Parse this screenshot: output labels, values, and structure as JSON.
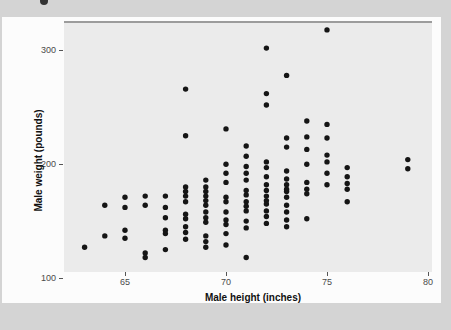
{
  "page": {
    "background_color": "#d4d4d4",
    "card_color": "#fcfcfc"
  },
  "chart_data": {
    "type": "scatter",
    "title": "",
    "xlabel": "Male height (inches)",
    "ylabel": "Male weight (pounds)",
    "x_ticks": [
      65,
      70,
      75,
      80
    ],
    "y_ticks": [
      100,
      200,
      300
    ],
    "xlim": [
      62,
      80.2
    ],
    "ylim": [
      95,
      326
    ],
    "grid": "off",
    "legend": "none",
    "panel_color": "#ebebeb",
    "point_color": "#151515",
    "points": [
      [
        63,
        127
      ],
      [
        64,
        164
      ],
      [
        64,
        137
      ],
      [
        65,
        171
      ],
      [
        65,
        162
      ],
      [
        65,
        142
      ],
      [
        65,
        135
      ],
      [
        66,
        172
      ],
      [
        66,
        164
      ],
      [
        66,
        122
      ],
      [
        66,
        118
      ],
      [
        67,
        172
      ],
      [
        67,
        162
      ],
      [
        67,
        153
      ],
      [
        67,
        142
      ],
      [
        67,
        139
      ],
      [
        67,
        125
      ],
      [
        68,
        266
      ],
      [
        68,
        225
      ],
      [
        68,
        180
      ],
      [
        68,
        176
      ],
      [
        68,
        172
      ],
      [
        68,
        167
      ],
      [
        68,
        156
      ],
      [
        68,
        152
      ],
      [
        68,
        145
      ],
      [
        68,
        140
      ],
      [
        68,
        134
      ],
      [
        69,
        186
      ],
      [
        69,
        180
      ],
      [
        69,
        176
      ],
      [
        69,
        172
      ],
      [
        69,
        168
      ],
      [
        69,
        164
      ],
      [
        69,
        158
      ],
      [
        69,
        153
      ],
      [
        69,
        149
      ],
      [
        69,
        137
      ],
      [
        69,
        132
      ],
      [
        69,
        127
      ],
      [
        70,
        231
      ],
      [
        70,
        200
      ],
      [
        70,
        192
      ],
      [
        70,
        184
      ],
      [
        70,
        171
      ],
      [
        70,
        167
      ],
      [
        70,
        158
      ],
      [
        70,
        151
      ],
      [
        70,
        147
      ],
      [
        70,
        139
      ],
      [
        70,
        129
      ],
      [
        71,
        216
      ],
      [
        71,
        207
      ],
      [
        71,
        198
      ],
      [
        71,
        192
      ],
      [
        71,
        186
      ],
      [
        71,
        177
      ],
      [
        71,
        173
      ],
      [
        71,
        167
      ],
      [
        71,
        163
      ],
      [
        71,
        159
      ],
      [
        71,
        150
      ],
      [
        71,
        144
      ],
      [
        71,
        118
      ],
      [
        72,
        302
      ],
      [
        72,
        262
      ],
      [
        72,
        252
      ],
      [
        72,
        202
      ],
      [
        72,
        197
      ],
      [
        72,
        189
      ],
      [
        72,
        182
      ],
      [
        72,
        177
      ],
      [
        72,
        172
      ],
      [
        72,
        168
      ],
      [
        72,
        165
      ],
      [
        72,
        159
      ],
      [
        72,
        154
      ],
      [
        72,
        148
      ],
      [
        73,
        278
      ],
      [
        73,
        223
      ],
      [
        73,
        215
      ],
      [
        73,
        194
      ],
      [
        73,
        187
      ],
      [
        73,
        182
      ],
      [
        73,
        178
      ],
      [
        73,
        176
      ],
      [
        73,
        171
      ],
      [
        73,
        164
      ],
      [
        73,
        158
      ],
      [
        73,
        151
      ],
      [
        73,
        145
      ],
      [
        74,
        238
      ],
      [
        74,
        224
      ],
      [
        74,
        213
      ],
      [
        74,
        200
      ],
      [
        74,
        184
      ],
      [
        74,
        178
      ],
      [
        74,
        174
      ],
      [
        74,
        152
      ],
      [
        75,
        318
      ],
      [
        75,
        235
      ],
      [
        75,
        223
      ],
      [
        75,
        208
      ],
      [
        75,
        202
      ],
      [
        75,
        192
      ],
      [
        75,
        182
      ],
      [
        76,
        197
      ],
      [
        76,
        189
      ],
      [
        76,
        183
      ],
      [
        76,
        178
      ],
      [
        76,
        167
      ],
      [
        79,
        204
      ],
      [
        79,
        196
      ]
    ]
  }
}
